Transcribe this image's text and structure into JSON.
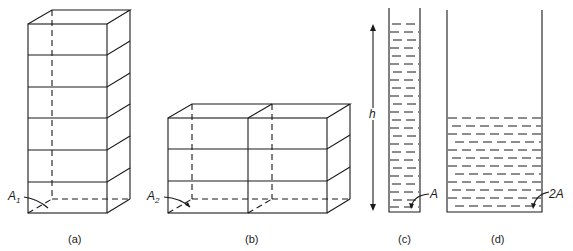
{
  "figure": {
    "panels": [
      {
        "id": "a",
        "caption": "(a)",
        "area_label": "A",
        "area_subscript": "1",
        "description": "tall rectangular column of 6 stacked blocks"
      },
      {
        "id": "b",
        "caption": "(b)",
        "area_label": "A",
        "area_subscript": "2",
        "description": "wide block of 2 columns x 3 layers"
      },
      {
        "id": "c",
        "caption": "(c)",
        "height_label": "h",
        "area_label": "A",
        "description": "narrow tube full of liquid"
      },
      {
        "id": "d",
        "caption": "(d)",
        "area_label": "2A",
        "description": "wide container with liquid at half height"
      }
    ]
  }
}
